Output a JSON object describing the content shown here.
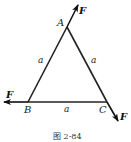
{
  "figure": {
    "caption": "图 2-84",
    "vertices": {
      "A": {
        "label": "A",
        "x": 67,
        "y": 27
      },
      "B": {
        "label": "B",
        "x": 28,
        "y": 102
      },
      "C": {
        "label": "C",
        "x": 107,
        "y": 102
      }
    },
    "sides": {
      "AB": {
        "label": "a"
      },
      "AC": {
        "label": "a"
      },
      "BC": {
        "label": "a"
      }
    },
    "forces": {
      "at_A": {
        "label": "F",
        "direction": "along CA extended, outward"
      },
      "at_B": {
        "label": "F",
        "direction": "along CB extended, outward (leftward)"
      },
      "at_C": {
        "label": "F",
        "direction": "along AC extended, outward"
      }
    },
    "colors": {
      "line": "#222222",
      "background": "#ffffff"
    }
  }
}
